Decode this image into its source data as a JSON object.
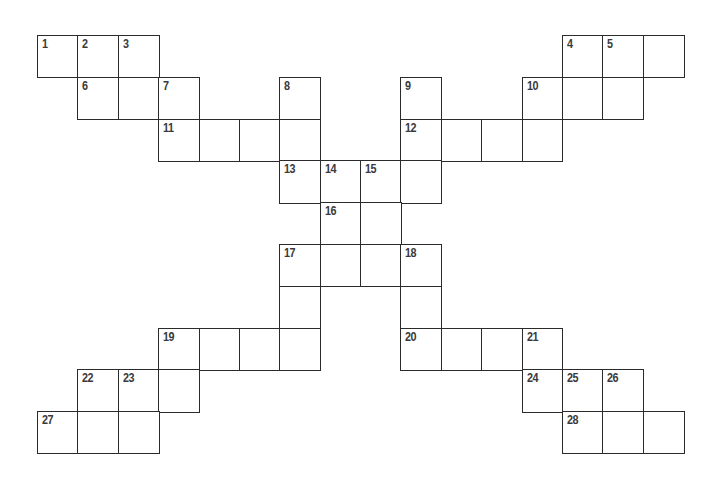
{
  "puzzle": {
    "type": "crossword",
    "columns": 16,
    "rows": 10,
    "colors": {
      "border": "#2b2b2b",
      "number": "#3a3a3a",
      "cell_fill": "#ffffff",
      "background": "#ffffff"
    },
    "cells": [
      {
        "row": 0,
        "col": 0,
        "number": "1"
      },
      {
        "row": 0,
        "col": 1,
        "number": "2"
      },
      {
        "row": 0,
        "col": 2,
        "number": "3"
      },
      {
        "row": 0,
        "col": 13,
        "number": "4"
      },
      {
        "row": 0,
        "col": 14,
        "number": "5"
      },
      {
        "row": 0,
        "col": 15,
        "number": ""
      },
      {
        "row": 1,
        "col": 1,
        "number": "6"
      },
      {
        "row": 1,
        "col": 2,
        "number": ""
      },
      {
        "row": 1,
        "col": 3,
        "number": "7"
      },
      {
        "row": 1,
        "col": 6,
        "number": "8"
      },
      {
        "row": 1,
        "col": 9,
        "number": "9"
      },
      {
        "row": 1,
        "col": 12,
        "number": "10"
      },
      {
        "row": 1,
        "col": 13,
        "number": ""
      },
      {
        "row": 1,
        "col": 14,
        "number": ""
      },
      {
        "row": 2,
        "col": 3,
        "number": "11"
      },
      {
        "row": 2,
        "col": 4,
        "number": ""
      },
      {
        "row": 2,
        "col": 5,
        "number": ""
      },
      {
        "row": 2,
        "col": 6,
        "number": ""
      },
      {
        "row": 2,
        "col": 9,
        "number": "12"
      },
      {
        "row": 2,
        "col": 10,
        "number": ""
      },
      {
        "row": 2,
        "col": 11,
        "number": ""
      },
      {
        "row": 2,
        "col": 12,
        "number": ""
      },
      {
        "row": 3,
        "col": 6,
        "number": "13"
      },
      {
        "row": 3,
        "col": 7,
        "number": "14"
      },
      {
        "row": 3,
        "col": 8,
        "number": "15"
      },
      {
        "row": 3,
        "col": 9,
        "number": ""
      },
      {
        "row": 4,
        "col": 7,
        "number": "16"
      },
      {
        "row": 4,
        "col": 8,
        "number": ""
      },
      {
        "row": 5,
        "col": 6,
        "number": "17"
      },
      {
        "row": 5,
        "col": 7,
        "number": ""
      },
      {
        "row": 5,
        "col": 8,
        "number": ""
      },
      {
        "row": 5,
        "col": 9,
        "number": "18"
      },
      {
        "row": 6,
        "col": 6,
        "number": ""
      },
      {
        "row": 6,
        "col": 9,
        "number": ""
      },
      {
        "row": 7,
        "col": 3,
        "number": "19"
      },
      {
        "row": 7,
        "col": 4,
        "number": ""
      },
      {
        "row": 7,
        "col": 5,
        "number": ""
      },
      {
        "row": 7,
        "col": 6,
        "number": ""
      },
      {
        "row": 7,
        "col": 9,
        "number": "20"
      },
      {
        "row": 7,
        "col": 10,
        "number": ""
      },
      {
        "row": 7,
        "col": 11,
        "number": ""
      },
      {
        "row": 7,
        "col": 12,
        "number": "21"
      },
      {
        "row": 8,
        "col": 1,
        "number": "22"
      },
      {
        "row": 8,
        "col": 2,
        "number": "23"
      },
      {
        "row": 8,
        "col": 3,
        "number": ""
      },
      {
        "row": 8,
        "col": 12,
        "number": "24"
      },
      {
        "row": 8,
        "col": 13,
        "number": "25"
      },
      {
        "row": 8,
        "col": 14,
        "number": "26"
      },
      {
        "row": 9,
        "col": 0,
        "number": "27"
      },
      {
        "row": 9,
        "col": 1,
        "number": ""
      },
      {
        "row": 9,
        "col": 2,
        "number": ""
      },
      {
        "row": 9,
        "col": 13,
        "number": "28"
      },
      {
        "row": 9,
        "col": 14,
        "number": ""
      },
      {
        "row": 9,
        "col": 15,
        "number": ""
      }
    ]
  }
}
